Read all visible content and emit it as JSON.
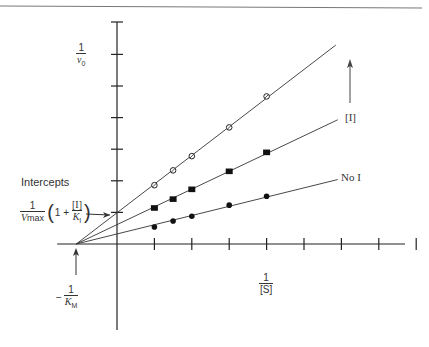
{
  "chart_data": {
    "type": "line",
    "title": "",
    "xlabel": "1/[S]",
    "ylabel": "1/v0",
    "x_ticks": [
      1,
      2,
      3,
      4,
      5,
      6,
      7,
      8
    ],
    "y_ticks": [
      1,
      2,
      3,
      4,
      5,
      6
    ],
    "grid": false,
    "xlim": [
      -1.1,
      7.7
    ],
    "ylim": [
      -2.7,
      7.0
    ],
    "x_intercept": -1.09,
    "series": [
      {
        "name": "No I",
        "marker": "filled-circle",
        "x": [
          1,
          1.5,
          2,
          3,
          4
        ],
        "values": [
          0.54,
          0.73,
          0.88,
          1.23,
          1.51
        ]
      },
      {
        "name": "[I]",
        "marker": "filled-square",
        "x": [
          1,
          1.5,
          2,
          3,
          4
        ],
        "values": [
          1.14,
          1.42,
          1.73,
          2.3,
          2.9
        ]
      },
      {
        "name": "higher [I]",
        "marker": "open-circle",
        "x": [
          1,
          1.5,
          2,
          3,
          4
        ],
        "values": [
          1.86,
          2.33,
          2.78,
          3.69,
          4.67
        ]
      }
    ],
    "annotations": [
      "Intercepts",
      "1/Vmax (1 + [I]/KI)",
      "-1/KM",
      "[I] (arrow indicating increasing inhibitor)",
      "No I"
    ]
  },
  "labels": {
    "y_num": "1",
    "y_den": "v",
    "y_den_sub": "0",
    "x_num": "1",
    "x_den": "[S]",
    "intercepts": "Intercepts",
    "vmax_num": "1",
    "vmax_den": "V",
    "vmax_sub": "max",
    "paren_open": "(",
    "one_plus": "1 +",
    "inh_num": "[I]",
    "inh_den": "K",
    "inh_sub": "I",
    "paren_close": ")",
    "km_minus": "−",
    "km_num": "1",
    "km_den": "K",
    "km_sub": "M",
    "inhibitor_label": "[I]",
    "no_inhibitor_label": "No I"
  }
}
